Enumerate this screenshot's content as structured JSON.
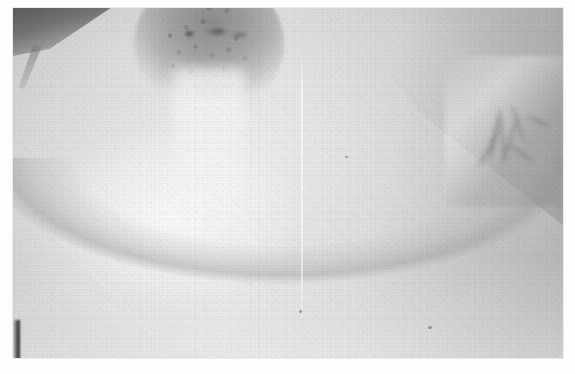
{
  "figure": {
    "kind": "clinical-photograph",
    "modality": "grayscale photographic print",
    "caption": "",
    "palette": {
      "paper_white": "#fdfdfd",
      "print_highlight": "#f6f6f6",
      "skin_midtone": "#e4e4e4",
      "skin_shadow": "#b6b6b6",
      "areola_tone": "#8c8c8c",
      "deep_shadow": "#4a4a4a",
      "edge_streak": "#2a2a2a"
    },
    "print": {
      "left": 13,
      "top": 8,
      "width": 550,
      "height": 350
    },
    "regions": [
      {
        "name": "breast-body",
        "label": "breast body",
        "note": "large rounded mound filling most of frame"
      },
      {
        "name": "areola",
        "label": "areola",
        "note": "darkened circular areola, upper-left of centre, cropped by top edge"
      },
      {
        "name": "areola-tubercles",
        "label": "montgomery tubercles",
        "note": "fine pebbled nodular surface texture across areola"
      },
      {
        "name": "nipple-shadow",
        "label": "nipple shadow marks",
        "note": "dark flecks along the superior areolar margin"
      },
      {
        "name": "central-highlight",
        "label": "specular skin highlight",
        "note": "bright vertical flash reflection below areola"
      },
      {
        "name": "inframammary-fold",
        "label": "inframammary fold shadow",
        "note": "broad dark arc along the inferior breast contour"
      },
      {
        "name": "lateral-chest-wall",
        "label": "lateral chest wall shading",
        "note": "progressive darkening toward the right of frame"
      },
      {
        "name": "axillary-fold",
        "label": "anterior axillary fold",
        "note": "creased skin and shadow at the right margin"
      },
      {
        "name": "upper-left-shadow",
        "label": "upper-left dark wedge",
        "note": "diagonal dark band entering from top-left corner"
      }
    ],
    "artifacts": [
      {
        "name": "scan-line",
        "label": "vertical scan line",
        "note": "faint pale vertical streak, right of centre"
      },
      {
        "name": "edge-streak",
        "label": "dark edge streak",
        "note": "short black vertical mark at lower right print edge"
      },
      {
        "name": "film-grain",
        "label": "film grain",
        "note": "fine halftone/grain texture across the whole print"
      },
      {
        "name": "print-border",
        "label": "white print border",
        "note": "unprinted white paper margin surrounding the image"
      }
    ]
  }
}
